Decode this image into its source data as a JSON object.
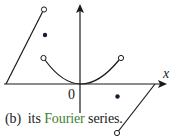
{
  "figure": {
    "caption_prefix": "(b)  its ",
    "caption_highlight": "Fourier",
    "caption_suffix": " series.",
    "axis_x_label": "x",
    "origin_label": "0",
    "colors": {
      "line": "#1a1a1a",
      "dot": "#1a1a3a",
      "highlight": "#3f7f32"
    }
  }
}
